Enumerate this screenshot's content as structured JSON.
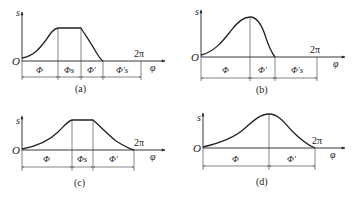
{
  "figure": {
    "panels": [
      {
        "id": "a",
        "caption": "(a)",
        "y_axis_label": "s",
        "x_axis_label": "φ",
        "origin_label": "O",
        "x_end_label": "2π",
        "segments": [
          "Φ",
          "Φs",
          "Φ′",
          "Φ′s"
        ],
        "curve_type": "rise-dwell-return-dwell"
      },
      {
        "id": "b",
        "caption": "(b)",
        "y_axis_label": "s",
        "x_axis_label": "φ",
        "origin_label": "O",
        "x_end_label": "2π",
        "segments": [
          "Φ",
          "Φ′",
          "Φ′s"
        ],
        "curve_type": "rise-return-dwell"
      },
      {
        "id": "c",
        "caption": "(c)",
        "y_axis_label": "s",
        "x_axis_label": "φ",
        "origin_label": "O",
        "x_end_label": "2π",
        "segments": [
          "Φ",
          "Φs",
          "Φ′"
        ],
        "curve_type": "rise-dwell-return"
      },
      {
        "id": "d",
        "caption": "(d)",
        "y_axis_label": "s",
        "x_axis_label": "φ",
        "origin_label": "O",
        "x_end_label": "2π",
        "segments": [
          "Φ",
          "Φ′"
        ],
        "curve_type": "rise-return"
      }
    ]
  }
}
